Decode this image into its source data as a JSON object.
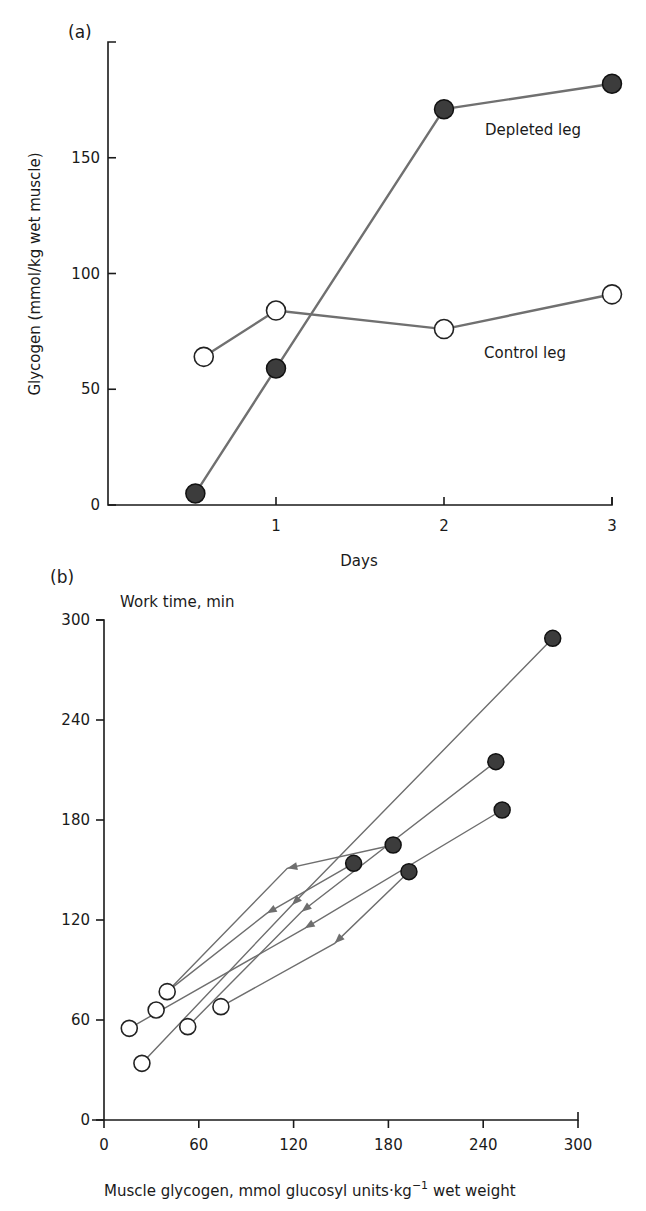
{
  "chart_data": [
    {
      "panel": "(a)",
      "type": "line",
      "title": "",
      "xlabel": "Days",
      "ylabel": "Glycogen (mmol/kg wet muscle)",
      "xlim": [
        0,
        3
      ],
      "ylim": [
        0,
        200
      ],
      "xticks": [
        1,
        2,
        3
      ],
      "yticks": [
        0,
        50,
        100,
        150
      ],
      "grid": false,
      "series": [
        {
          "name": "Depleted leg",
          "marker": "filled-circle",
          "x": [
            0.52,
            1,
            2,
            3
          ],
          "y": [
            5,
            59,
            171,
            182
          ],
          "label_pos": [
            485,
            135
          ]
        },
        {
          "name": "Control leg",
          "marker": "open-circle",
          "x": [
            0.57,
            1,
            2,
            3
          ],
          "y": [
            64,
            84,
            76,
            91
          ],
          "label_pos": [
            484,
            358
          ]
        }
      ]
    },
    {
      "panel": "(b)",
      "type": "scatter",
      "title": "",
      "xlabel": "Muscle glycogen, mmol glucosyl units·kg⁻¹ wet weight",
      "xlabel_parts": [
        "Muscle glycogen, mmol glucosyl units·kg",
        "−1",
        " wet weight"
      ],
      "ylabel": "Work time, min",
      "xlim": [
        0,
        300
      ],
      "ylim": [
        0,
        300
      ],
      "xticks": [
        0,
        60,
        120,
        180,
        240,
        300
      ],
      "yticks": [
        0,
        60,
        120,
        180,
        240,
        300
      ],
      "grid": false,
      "legend": "none",
      "paths": [
        {
          "open": [
            40,
            77
          ],
          "arrow": [
            116,
            151
          ],
          "filled": [
            183,
            165
          ]
        },
        {
          "open": [
            40,
            77
          ],
          "arrow": [
            103,
            124
          ],
          "filled": [
            158,
            154
          ]
        },
        {
          "open": [
            24,
            34
          ],
          "arrow": [
            119,
            129
          ],
          "filled": [
            284,
            289
          ]
        },
        {
          "open": [
            53,
            56
          ],
          "arrow": [
            125,
            125
          ],
          "filled": [
            248,
            215
          ]
        },
        {
          "open": [
            16,
            55
          ],
          "arrow": [
            127,
            115
          ],
          "filled": [
            252,
            186
          ]
        },
        {
          "open": [
            74,
            68
          ],
          "arrow": [
            146,
            106
          ],
          "filled": [
            193,
            149
          ]
        }
      ],
      "extra_open_points": [
        [
          33,
          66
        ]
      ]
    }
  ]
}
